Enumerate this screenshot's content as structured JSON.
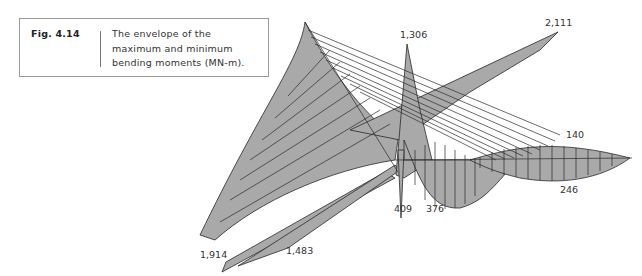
{
  "caption": {
    "figure_number": "Fig. 4.14",
    "text": "The envelope of the maximum and minimum bending moments (MN-m)."
  },
  "diagram": {
    "type": "bending-moment-envelope",
    "units": "MN-m",
    "fill_color": "#a9a9a9",
    "line_color": "#2a2a2a",
    "labels": {
      "peak_mid": "1,306",
      "peak_right_arm": "2,111",
      "right_span_max": "140",
      "right_span_min": "246",
      "support_left": "409",
      "support_right": "376",
      "left_arm_a": "1,914",
      "left_arm_b": "1,483"
    }
  }
}
